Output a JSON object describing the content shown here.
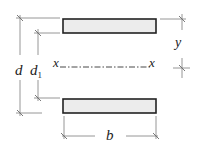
{
  "diagram": {
    "labels": {
      "d": "d",
      "d1": "d",
      "d1_sub": "1",
      "b": "b",
      "y": "y",
      "x_left": "x",
      "x_right": "x"
    },
    "elements": {
      "top_flange": {
        "x": 63,
        "y": 19,
        "w": 93,
        "h": 14
      },
      "bottom_flange": {
        "x": 63,
        "y": 99,
        "w": 93,
        "h": 14
      },
      "neutral_axis_y": 67
    },
    "colors": {
      "flange_fill": "#ececec",
      "flange_stroke": "#222222",
      "dimension_line": "#8a8a8a",
      "text": "#222222"
    }
  }
}
